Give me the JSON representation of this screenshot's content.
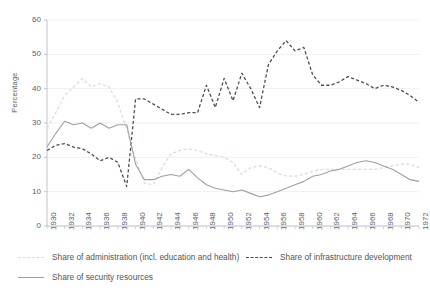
{
  "chart_data": {
    "type": "line",
    "title": "",
    "xlabel": "",
    "ylabel": "Percentage",
    "ylim": [
      0,
      60
    ],
    "xlim": [
      1930,
      1972
    ],
    "grid": true,
    "legend_position": "bottom",
    "ytick_labels": [
      "0",
      "10",
      "20",
      "30",
      "40",
      "50",
      "60"
    ],
    "ytick_values": [
      0,
      10,
      20,
      30,
      40,
      50,
      60
    ],
    "xtick_labels": [
      "1930",
      "1932",
      "1934",
      "1936",
      "1938",
      "1940",
      "1942",
      "1944",
      "1946",
      "1948",
      "1950",
      "1952",
      "1954",
      "1956",
      "1958",
      "1960",
      "1962",
      "1964",
      "1966",
      "1968",
      "1970",
      "1972"
    ],
    "x": [
      1930,
      1931,
      1932,
      1933,
      1934,
      1935,
      1936,
      1937,
      1938,
      1939,
      1940,
      1941,
      1942,
      1943,
      1944,
      1945,
      1946,
      1947,
      1948,
      1949,
      1950,
      1951,
      1952,
      1953,
      1954,
      1955,
      1956,
      1957,
      1958,
      1959,
      1960,
      1961,
      1962,
      1963,
      1964,
      1965,
      1966,
      1967,
      1968,
      1969,
      1970,
      1971,
      1972
    ],
    "series": [
      {
        "name": "Share of administration (incl. education and health)",
        "style": "dashed",
        "color": "#d9dde0",
        "values": [
          28.5,
          33.0,
          38.0,
          40.5,
          43.0,
          40.5,
          41.5,
          40.5,
          36.0,
          28.0,
          19.5,
          12.5,
          12.0,
          17.0,
          21.0,
          22.0,
          22.5,
          22.0,
          21.0,
          20.5,
          20.0,
          18.5,
          15.0,
          17.0,
          17.5,
          17.0,
          15.5,
          14.5,
          14.5,
          15.0,
          16.0,
          16.5,
          16.5,
          16.5,
          16.5,
          16.5,
          16.5,
          16.5,
          17.0,
          17.5,
          18.0,
          18.0,
          17.0
        ]
      },
      {
        "name": "Share of infrastructure development",
        "style": "dashed",
        "color": "#4a5057",
        "values": [
          22.0,
          23.5,
          24.0,
          23.0,
          22.5,
          21.0,
          19.0,
          20.0,
          18.5,
          11.5,
          37.0,
          37.0,
          35.5,
          34.0,
          32.5,
          32.5,
          33.0,
          33.0,
          41.0,
          34.5,
          43.0,
          36.5,
          44.5,
          40.0,
          34.5,
          47.0,
          51.0,
          54.0,
          51.0,
          52.0,
          44.0,
          41.0,
          41.0,
          42.0,
          43.5,
          42.5,
          41.5,
          40.0,
          41.0,
          40.5,
          39.5,
          38.0,
          36.0
        ]
      },
      {
        "name": "Share of security resources",
        "style": "solid",
        "color": "#9aa1a8",
        "values": [
          23.0,
          27.0,
          30.5,
          29.5,
          30.0,
          28.5,
          30.0,
          28.5,
          29.5,
          29.5,
          18.0,
          13.5,
          13.5,
          14.5,
          15.0,
          14.5,
          16.5,
          14.0,
          12.0,
          11.0,
          10.5,
          10.0,
          10.5,
          9.5,
          8.5,
          9.0,
          10.0,
          11.0,
          12.0,
          13.0,
          14.5,
          15.0,
          16.0,
          16.5,
          17.5,
          18.5,
          19.0,
          18.5,
          17.5,
          16.5,
          15.0,
          13.5,
          13.0
        ]
      }
    ]
  },
  "legend": {
    "items": [
      {
        "label": "Share of administration (incl. education and health)"
      },
      {
        "label": "Share of infrastructure development"
      },
      {
        "label": "Share of security resources"
      }
    ]
  }
}
